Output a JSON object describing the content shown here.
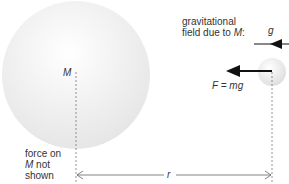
{
  "diagram": {
    "large_mass_label": "M",
    "field_label_line1": "gravitational",
    "field_label_line2_prefix": "field due to ",
    "field_label_line2_var": "M",
    "field_label_line2_suffix": ":",
    "field_symbol": "g",
    "force_label": "F = mg",
    "note_line1": "force on",
    "note_line2_var": "M",
    "note_line2_suffix": " not",
    "note_line3": "shown",
    "distance_label": "r"
  },
  "colors": {
    "sphere_fill": "#eeeeee",
    "arrow": "#111111",
    "line": "#666666"
  }
}
